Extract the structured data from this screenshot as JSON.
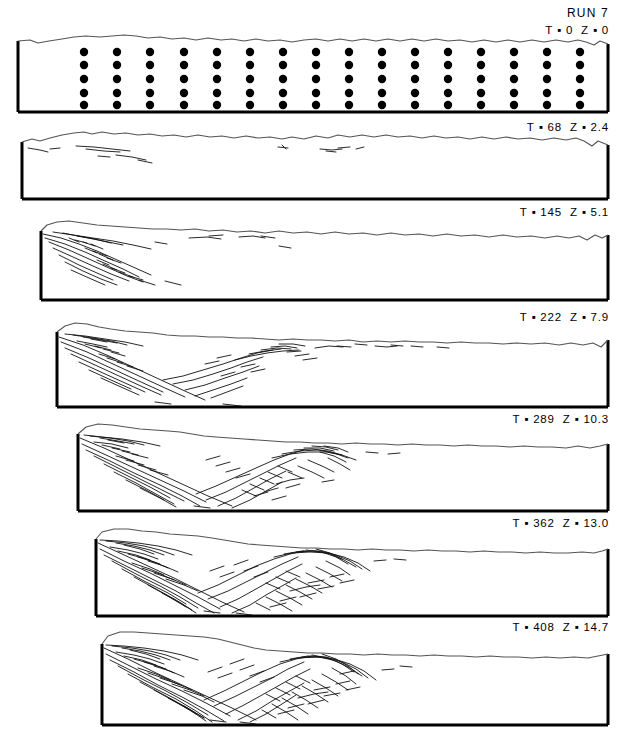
{
  "figure": {
    "run_label": "RUN 7",
    "caption_style": "sequential cross-sections of shortening experiment",
    "ink_color": "#000000",
    "background_color": "#ffffff",
    "surface_line_color": "#8a8a8a"
  },
  "panels": [
    {
      "id": "panel-1",
      "index": 1,
      "time_label": "T",
      "time_value": "0",
      "shortening_label": "Z",
      "shortening_value": "0",
      "label_text": "T ▪ 0  Z ▪ 0",
      "t": 0,
      "z": 0.0,
      "marker_grid": {
        "columns": 16,
        "rows": 5,
        "dot_radius_px": 4.1
      },
      "fault_count": 0,
      "state": "undeformed"
    },
    {
      "id": "panel-2",
      "index": 2,
      "time_label": "T",
      "time_value": "68",
      "shortening_label": "Z",
      "shortening_value": "2.4",
      "label_text": "T ▪ 68  Z ▪ 2.4",
      "t": 68,
      "z": 2.4,
      "fault_count": 6,
      "state": "incipient faulting, left margin"
    },
    {
      "id": "panel-3",
      "index": 3,
      "time_label": "T",
      "time_value": "145",
      "shortening_label": "Z",
      "shortening_value": "5.1",
      "label_text": "T ▪ 145  Z ▪ 5.1",
      "t": 145,
      "z": 5.1,
      "fault_count": 22,
      "state": "imbricate thrust fan developed at left"
    },
    {
      "id": "panel-4",
      "index": 4,
      "time_label": "T",
      "time_value": "222",
      "shortening_label": "Z",
      "shortening_value": "7.9",
      "label_text": "T ▪ 222  Z ▪ 7.9",
      "t": 222,
      "z": 7.9,
      "fault_count": 38,
      "state": "wedge propagating forward"
    },
    {
      "id": "panel-5",
      "index": 5,
      "time_label": "T",
      "time_value": "289",
      "shortening_label": "Z",
      "shortening_value": "10.3",
      "label_text": "T ▪ 289  Z ▪ 10.3",
      "t": 289,
      "z": 10.3,
      "fault_count": 52,
      "state": "second thrust stack forms"
    },
    {
      "id": "panel-6",
      "index": 6,
      "time_label": "T",
      "time_value": "362",
      "shortening_label": "Z",
      "shortening_value": "13.0",
      "label_text": "T ▪ 362  Z ▪ 13.0",
      "t": 362,
      "z": 13.0,
      "fault_count": 64,
      "state": "mature wedge, thickened hinterland"
    },
    {
      "id": "panel-7",
      "index": 7,
      "time_label": "T",
      "time_value": "408",
      "shortening_label": "Z",
      "shortening_value": "14.7",
      "label_text": "T ▪ 408  Z ▪ 14.7",
      "t": 408,
      "z": 14.7,
      "fault_count": 70,
      "state": "final stage, intense internal imbrication"
    }
  ]
}
